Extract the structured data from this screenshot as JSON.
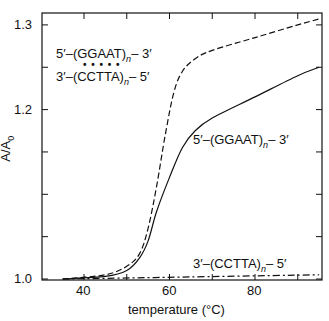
{
  "chart_data": {
    "type": "line",
    "title": "",
    "xlabel": "temperature (°C)",
    "ylabel": "A/A0",
    "xlim": [
      30,
      95.5
    ],
    "ylim": [
      0.99,
      1.315
    ],
    "xticks": [
      40,
      60,
      80
    ],
    "yticks": [
      "1.0",
      "1.2",
      "1.3"
    ],
    "grid": false,
    "series": [
      {
        "name": "5'-(GGAAT)n-3' • 3'-(CCTTA)n-5' (duplex)",
        "style": "dashed",
        "x": [
          35,
          45,
          50,
          53,
          55,
          57,
          59,
          61,
          63,
          66,
          70,
          80,
          90,
          95
        ],
        "y": [
          1.0,
          1.005,
          1.015,
          1.03,
          1.06,
          1.11,
          1.17,
          1.22,
          1.245,
          1.26,
          1.27,
          1.285,
          1.3,
          1.307
        ]
      },
      {
        "name": "5'-(GGAAT)n-3'",
        "style": "solid",
        "x": [
          35,
          45,
          50,
          53,
          55,
          57,
          60,
          63,
          66,
          70,
          80,
          90,
          95
        ],
        "y": [
          1.0,
          1.003,
          1.01,
          1.025,
          1.045,
          1.08,
          1.12,
          1.155,
          1.175,
          1.19,
          1.215,
          1.24,
          1.25
        ]
      },
      {
        "name": "3'-(CCTTA)n-5'",
        "style": "dash-dot",
        "x": [
          35,
          60,
          95
        ],
        "y": [
          1.0,
          1.002,
          1.005
        ]
      }
    ]
  },
  "labels": {
    "duplex_top": "5′–(GGAAT)",
    "duplex_top_end": "– 3′",
    "duplex_dots": "• • • • •",
    "duplex_bottom": "3′–(CCTTA)",
    "duplex_bottom_end": "– 5′",
    "solid_label": "5′–(GGAAT)",
    "solid_label_end": "– 3′",
    "dashdot_label": "3′–(CCTTA)",
    "dashdot_label_end": "– 5′",
    "n": "n",
    "ylabel": "A/A",
    "ylabel_sub": "0",
    "xlabel": "temperature (°C)",
    "x40": "40",
    "x60": "60",
    "x80": "80",
    "y10": "1.0",
    "y12": "1.2",
    "y13": "1.3"
  }
}
